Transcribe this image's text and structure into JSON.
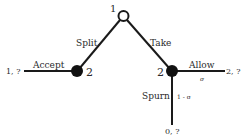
{
  "diagram": {
    "type": "extensive-form game tree",
    "colors": {
      "line": "#1a1a1a",
      "text": "#2a2a2a",
      "background": "#ffffff"
    },
    "nodes": {
      "root": {
        "player": "1",
        "style": "open"
      },
      "left": {
        "player": "2",
        "style": "filled"
      },
      "right": {
        "player": "2",
        "style": "filled"
      }
    },
    "edges": {
      "split": {
        "label": "Split"
      },
      "take": {
        "label": "Take"
      },
      "accept": {
        "label": "Accept"
      },
      "allow": {
        "label": "Allow",
        "probability": "σ"
      },
      "spurn": {
        "label": "Spurn",
        "probability": "1 - σ"
      }
    },
    "payoffs": {
      "accept": "1, ?",
      "allow": "2, ?",
      "spurn": "0, ?"
    }
  }
}
